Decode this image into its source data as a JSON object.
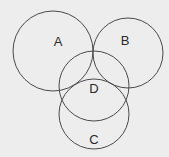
{
  "diagram": {
    "type": "venn",
    "background": "#ededed",
    "stroke_color": "#4a4a4a",
    "text_color": "#2a2a2a",
    "circles": [
      {
        "id": "A",
        "label": "A",
        "cx": 53,
        "cy": 51,
        "r": 40,
        "label_x": 58,
        "label_y": 46
      },
      {
        "id": "B",
        "label": "B",
        "cx": 128,
        "cy": 53,
        "r": 35,
        "label_x": 125,
        "label_y": 45
      },
      {
        "id": "D",
        "label": "D",
        "cx": 94,
        "cy": 86,
        "r": 35,
        "label_x": 94,
        "label_y": 93
      },
      {
        "id": "C",
        "label": "C",
        "cx": 94,
        "cy": 114,
        "r": 35,
        "label_x": 94,
        "label_y": 144
      }
    ]
  }
}
